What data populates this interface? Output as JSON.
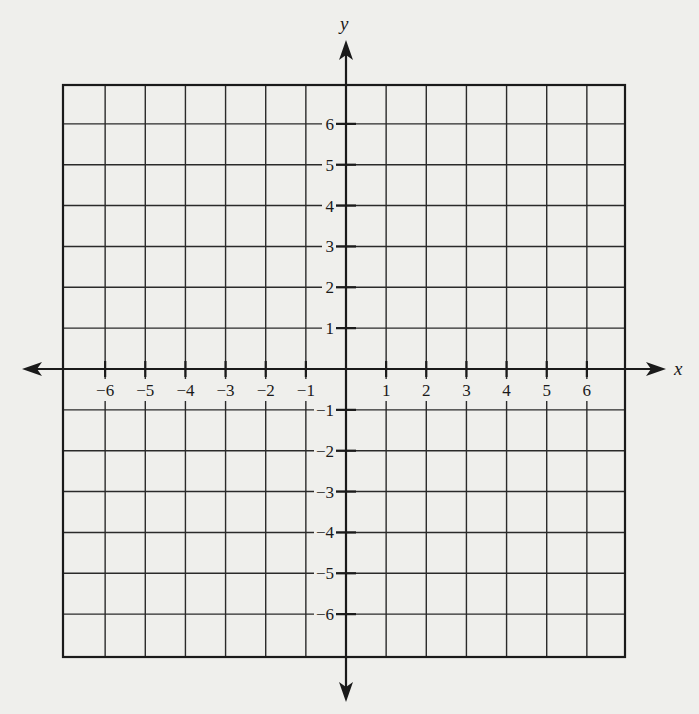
{
  "colors": {
    "paper": "#efefec",
    "ink": "#1a1a1a",
    "grid": "#2a2a2a"
  },
  "diagram": {
    "type": "coordinate-plane",
    "x_axis": {
      "label": "x",
      "range": [
        -7,
        7
      ],
      "tick_labels": [
        "−6",
        "−5",
        "−4",
        "−3",
        "−2",
        "−1",
        "1",
        "2",
        "3",
        "4",
        "5",
        "6"
      ],
      "tick_values": [
        -6,
        -5,
        -4,
        -3,
        -2,
        -1,
        1,
        2,
        3,
        4,
        5,
        6
      ]
    },
    "y_axis": {
      "label": "y",
      "range": [
        -7,
        7
      ],
      "tick_labels": [
        "6",
        "5",
        "4",
        "3",
        "2",
        "1",
        "−1",
        "−2",
        "−3",
        "−4",
        "−5",
        "−6"
      ],
      "tick_values": [
        6,
        5,
        4,
        3,
        2,
        1,
        -1,
        -2,
        -3,
        -4,
        -5,
        -6
      ]
    },
    "grid": {
      "columns": 14,
      "rows": 14,
      "cell_units": 1
    }
  }
}
